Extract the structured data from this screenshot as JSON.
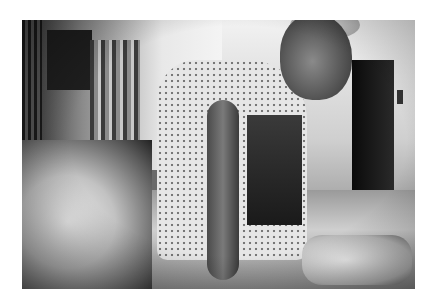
{
  "image": {
    "type": "photograph",
    "color_mode": "black-and-white",
    "background_color": "#ffffff",
    "frame": {
      "left": 22,
      "top": 20,
      "width": 393,
      "height": 269
    },
    "alt": "Black-and-white photograph of an elderly, thin man in a dotted hospital gown sitting on the edge of a hospital bed, looking toward the camera, while gloved hands attend to his arm; a small monitor and curtains are visible in the background."
  },
  "scene": {
    "subjects": [
      "elderly man in hospital gown",
      "gloved hands of caregiver"
    ],
    "objects": [
      "hospital bed",
      "bed rail",
      "privacy curtains",
      "small monitor",
      "IV pole",
      "open doorway",
      "wall device"
    ]
  }
}
